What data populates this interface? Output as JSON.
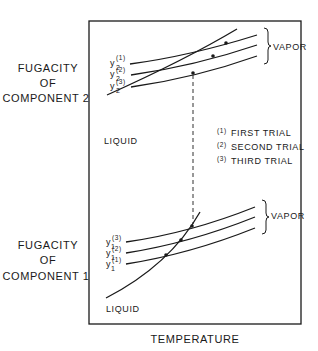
{
  "y_axis_upper": {
    "lines": [
      "FUGACITY",
      "OF",
      "COMPONENT 2"
    ]
  },
  "y_axis_lower": {
    "lines": [
      "FUGACITY",
      "OF",
      "COMPONENT 1"
    ]
  },
  "x_axis": {
    "label": "TEMPERATURE"
  },
  "upper_panel": {
    "liquid_label": "LIQUID",
    "vapor_label": "VAPOR",
    "vapor_curves": [
      {
        "var": "y",
        "sub": "2",
        "sup": "(1)"
      },
      {
        "var": "y",
        "sub": "2",
        "sup": "(2)"
      },
      {
        "var": "y",
        "sub": "2",
        "sup": "(3)"
      }
    ]
  },
  "lower_panel": {
    "liquid_label": "LIQUID",
    "vapor_label": "VAPOR",
    "vapor_curves": [
      {
        "var": "y",
        "sub": "1",
        "sup": "(3)"
      },
      {
        "var": "y",
        "sub": "1",
        "sup": "(2)"
      },
      {
        "var": "y",
        "sub": "1",
        "sup": "(1)"
      }
    ]
  },
  "legend": {
    "items": [
      {
        "marker": "(1)",
        "label": "FIRST TRIAL"
      },
      {
        "marker": "(2)",
        "label": "SECOND TRIAL"
      },
      {
        "marker": "(3)",
        "label": "THIRD TRIAL"
      }
    ]
  }
}
